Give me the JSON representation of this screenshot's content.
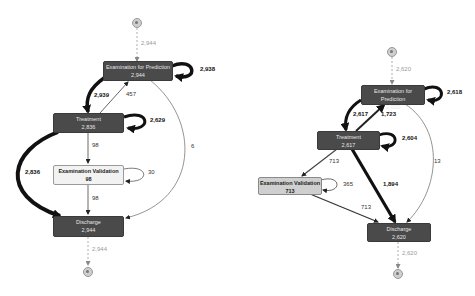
{
  "diagrams": [
    {
      "name": "process-map-left",
      "start_count": "2,944",
      "end_count": "2,944",
      "nodes": [
        {
          "id": "exam_prediction",
          "label": "Examination for Prediction",
          "count": "2,944"
        },
        {
          "id": "treatment",
          "label": "Treatment",
          "count": "2,836"
        },
        {
          "id": "exam_validation",
          "label": "Examination Validation",
          "count": "98"
        },
        {
          "id": "discharge",
          "label": "Discharge",
          "count": "2,944"
        }
      ],
      "edges": {
        "start_to_exam_prediction": "2,944",
        "exam_prediction_self": "2,938",
        "exam_prediction_to_treatment": "2,939",
        "treatment_to_exam_prediction": "457",
        "treatment_self": "2,629",
        "treatment_to_exam_validation": "98",
        "exam_prediction_to_discharge": "6",
        "exam_validation_self": "30",
        "exam_validation_to_discharge": "98",
        "treatment_to_discharge": "2,836",
        "discharge_to_end": "2,944"
      }
    },
    {
      "name": "process-map-right",
      "start_count": "2,620",
      "end_count": "2,620",
      "nodes": [
        {
          "id": "exam_prediction",
          "label": "Examination for Prediction",
          "count": "2,620"
        },
        {
          "id": "treatment",
          "label": "Treatment",
          "count": "2,617"
        },
        {
          "id": "exam_validation",
          "label": "Examination Validation",
          "count": "713"
        },
        {
          "id": "discharge",
          "label": "Discharge",
          "count": "2,620"
        }
      ],
      "edges": {
        "start_to_exam_prediction": "2,620",
        "exam_prediction_self": "2,618",
        "exam_prediction_to_treatment": "2,617",
        "treatment_to_exam_prediction": "1,723",
        "treatment_self": "2,604",
        "treatment_to_exam_validation": "713",
        "exam_validation_self": "365",
        "exam_validation_to_discharge": "713",
        "treatment_to_discharge": "1,894",
        "exam_prediction_to_discharge": "13",
        "discharge_to_end": "2,620"
      }
    }
  ],
  "colors": {
    "node_dark": "#4a4a4a",
    "node_light": "#f2f2f2",
    "node_mid": "#cfcfcf",
    "edge": "#222222",
    "edge_thin": "#666666",
    "dashed": "#999999"
  }
}
